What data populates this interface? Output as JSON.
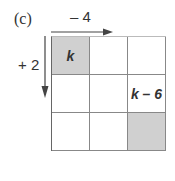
{
  "part_label": "(c)",
  "horizontal_step": "– 4",
  "vertical_step": "+ 2",
  "grid": {
    "rows": [
      [
        {
          "text": "k",
          "shaded": true
        },
        {
          "text": "",
          "shaded": false
        },
        {
          "text": "",
          "shaded": false
        }
      ],
      [
        {
          "text": "",
          "shaded": false
        },
        {
          "text": "",
          "shaded": false
        },
        {
          "text": "k – 6",
          "shaded": false
        }
      ],
      [
        {
          "text": "",
          "shaded": false
        },
        {
          "text": "",
          "shaded": false
        },
        {
          "text": "",
          "shaded": true
        }
      ]
    ]
  }
}
